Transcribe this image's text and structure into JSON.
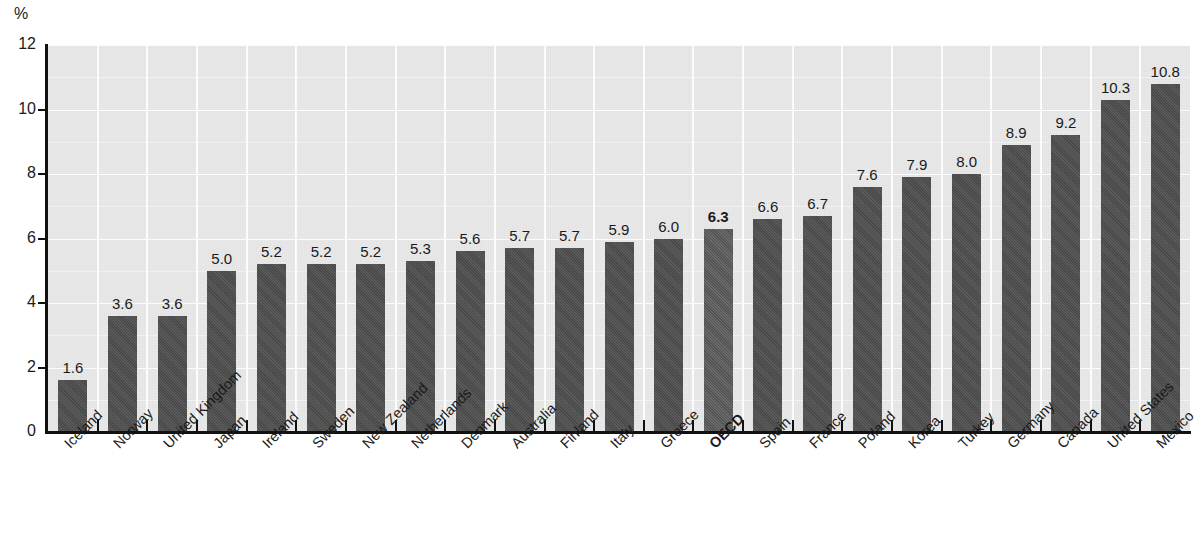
{
  "chart_data": {
    "type": "bar",
    "title": "",
    "subtitle": "",
    "xlabel": "",
    "ylabel": "%",
    "unit_label": "%",
    "ylim": [
      0,
      12
    ],
    "ytick_step": 2,
    "ytick_labels": [
      "12",
      "10",
      "8",
      "6",
      "4",
      "2",
      "0"
    ],
    "ytick_values": [
      12,
      10,
      8,
      6,
      4,
      2,
      0
    ],
    "grid": true,
    "gridlines_minor_step": 1,
    "legend": null,
    "legend_position": "none",
    "categories": [
      "Iceland",
      "Norway",
      "United Kingdom",
      "Japan",
      "Ireland",
      "Sweden",
      "New Zealand",
      "Netherlands",
      "Denmark",
      "Australia",
      "Finland",
      "Italy",
      "Greece",
      "OECD",
      "Spain",
      "France",
      "Poland",
      "Korea",
      "Turkey",
      "Germany",
      "Canada",
      "United States",
      "Mexico"
    ],
    "values": [
      1.6,
      3.6,
      3.6,
      5.0,
      5.2,
      5.2,
      5.2,
      5.3,
      5.6,
      5.7,
      5.7,
      5.9,
      6.0,
      6.3,
      6.6,
      6.7,
      7.6,
      7.9,
      8.0,
      8.9,
      9.2,
      10.3,
      10.8
    ],
    "value_labels": [
      "1.6",
      "3.6",
      "3.6",
      "5.0",
      "5.2",
      "5.2",
      "5.2",
      "5.3",
      "5.6",
      "5.7",
      "5.7",
      "5.9",
      "6.0",
      "6.3",
      "6.6",
      "6.7",
      "7.6",
      "7.9",
      "8.0",
      "8.9",
      "9.2",
      "10.3",
      "10.8"
    ],
    "highlight_index": 13,
    "highlight_category": "OECD",
    "colors": {
      "bar": "#4d4d4d",
      "bar_highlight": "#585858",
      "plot_background": "#e9e9e9",
      "gridline": "#ffffff",
      "axis": "#111111",
      "text": "#1a1a1a",
      "page_background": "#ffffff"
    }
  }
}
